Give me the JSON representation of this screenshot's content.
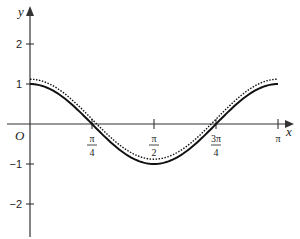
{
  "chart_data": {
    "type": "line",
    "title": "",
    "xlabel": "x",
    "ylabel": "y",
    "origin_label": "O",
    "xlim": [
      0,
      3.14159
    ],
    "ylim": [
      -2.8,
      2.9
    ],
    "x_ticks": [
      {
        "value": 0.7854,
        "num": "π",
        "den": "4"
      },
      {
        "value": 1.5708,
        "num": "π",
        "den": "2"
      },
      {
        "value": 2.3562,
        "num": "3π",
        "den": "4"
      },
      {
        "value": 3.14159,
        "num": "π",
        "den": ""
      }
    ],
    "y_ticks": [
      {
        "value": 2,
        "label": "2"
      },
      {
        "value": 1,
        "label": "1"
      },
      {
        "value": -1,
        "label": "−1"
      },
      {
        "value": -2,
        "label": "−2"
      }
    ],
    "grid": false,
    "series": [
      {
        "name": "solid curve",
        "style": "solid",
        "function": "cos(2x)",
        "x": [
          0,
          0.3927,
          0.7854,
          1.1781,
          1.5708,
          1.9635,
          2.3562,
          2.7489,
          3.14159
        ],
        "values": [
          1,
          0.707,
          0,
          -0.707,
          -1,
          -0.707,
          0,
          0.707,
          1
        ]
      },
      {
        "name": "dotted curve",
        "style": "dotted",
        "function": "approx cos(2x)+0.12",
        "x": [
          0,
          0.3927,
          0.7854,
          1.1781,
          1.5708,
          1.9635,
          2.3562,
          2.7489,
          3.14159
        ],
        "values": [
          1.12,
          0.827,
          0.12,
          -0.587,
          -0.88,
          -0.587,
          0.12,
          0.827,
          1.12
        ]
      }
    ]
  }
}
